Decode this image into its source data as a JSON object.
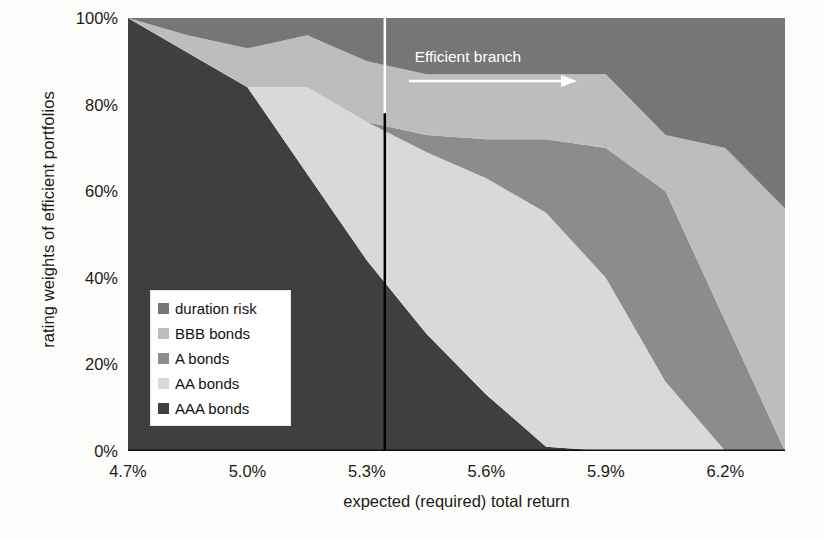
{
  "chart_data": {
    "type": "area",
    "stacked": true,
    "title": "",
    "xlabel": "expected (required) total return",
    "ylabel": "rating weights of efficient portfolios",
    "xtick_labels": [
      "4.7%",
      "5.0%",
      "5.3%",
      "5.6%",
      "5.9%",
      "6.2%"
    ],
    "xtick_values": [
      4.7,
      5.0,
      5.3,
      5.6,
      5.9,
      6.2
    ],
    "ytick_labels": [
      "0%",
      "20%",
      "40%",
      "60%",
      "80%",
      "100%"
    ],
    "ytick_values": [
      0,
      20,
      40,
      60,
      80,
      100
    ],
    "xlim": [
      4.7,
      6.35
    ],
    "ylim": [
      0,
      100
    ],
    "grid": false,
    "legend_position": "inside-left",
    "x": [
      4.7,
      4.85,
      5.0,
      5.15,
      5.3,
      5.45,
      5.6,
      5.75,
      5.9,
      6.05,
      6.2,
      6.35
    ],
    "series": [
      {
        "name": "AAA bonds",
        "color": "#3f3f3f",
        "values": [
          100,
          92,
          84,
          64,
          44,
          27,
          13,
          1,
          0,
          0,
          0,
          0
        ]
      },
      {
        "name": "AA bonds",
        "color": "#d9d9d9",
        "values": [
          0,
          0,
          0,
          20,
          32,
          42,
          50,
          54,
          40,
          16,
          0,
          0
        ]
      },
      {
        "name": "A bonds",
        "color": "#8c8c8c",
        "values": [
          0,
          0,
          0,
          0,
          0,
          4,
          9,
          17,
          30,
          44,
          30,
          0
        ]
      },
      {
        "name": "BBB bonds",
        "color": "#bdbdbd",
        "values": [
          0,
          4,
          9,
          12,
          14,
          14,
          15,
          15,
          17,
          13,
          40,
          56
        ]
      },
      {
        "name": "duration risk",
        "color": "#767676",
        "values": [
          0,
          4,
          7,
          4,
          10,
          13,
          13,
          13,
          13,
          27,
          30,
          44
        ]
      }
    ],
    "annotations": [
      {
        "name": "efficient-branch",
        "text": "Efficient branch",
        "x_start": 5.33,
        "color": "#ffffff",
        "arrow": "right"
      },
      {
        "name": "efficient-branch-divider",
        "type": "vline",
        "x": 5.345,
        "color_top": "#ffffff",
        "color_bottom": "#000000"
      }
    ]
  },
  "legend": {
    "items": [
      {
        "label": "duration risk",
        "color": "#767676"
      },
      {
        "label": "BBB bonds",
        "color": "#bdbdbd"
      },
      {
        "label": "A bonds",
        "color": "#8c8c8c"
      },
      {
        "label": "AA bonds",
        "color": "#d9d9d9"
      },
      {
        "label": "AAA bonds",
        "color": "#3f3f3f"
      }
    ]
  },
  "axes": {
    "y_title": "rating weights of efficient portfolios",
    "x_title": "expected (required) total return",
    "yticks": [
      "100%",
      "80%",
      "60%",
      "40%",
      "20%",
      "0%"
    ],
    "xticks": [
      "4.7%",
      "5.0%",
      "5.3%",
      "5.6%",
      "5.9%",
      "6.2%"
    ]
  },
  "annotation": {
    "efficient_branch_label": "Efficient branch"
  }
}
